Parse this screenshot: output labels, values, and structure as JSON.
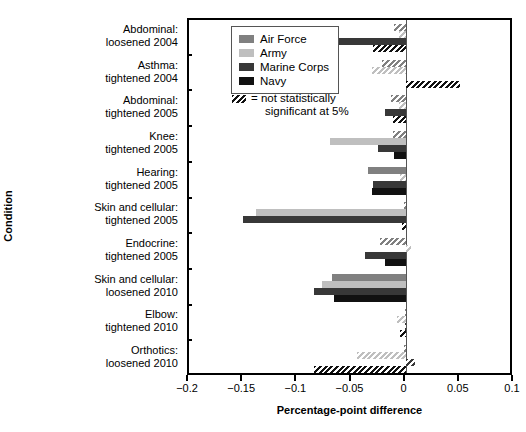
{
  "chart_data": {
    "type": "bar",
    "orientation": "horizontal",
    "title": "",
    "xlabel": "Percentage-point difference",
    "ylabel": "Condition",
    "xlim": [
      -0.2,
      0.1
    ],
    "xticks": [
      "-0.2",
      "-0.15",
      "-0.1",
      "-0.05",
      "0",
      "0.05",
      "0.1"
    ],
    "xtick_values": [
      -0.2,
      -0.15,
      -0.1,
      -0.05,
      0,
      0.05,
      0.1
    ],
    "grid": false,
    "zero_reference_line": true,
    "legend_position": "top-left-inside",
    "legend": [
      {
        "name": "Air Force",
        "color": "#808080"
      },
      {
        "name": "Army",
        "color": "#bfbfbf"
      },
      {
        "name": "Marine Corps",
        "color": "#383838"
      },
      {
        "name": "Navy",
        "color": "#111111"
      }
    ],
    "hatch_note": {
      "line1": "= not statistically",
      "line2": "significant at 5%"
    },
    "categories": [
      "Abdominal:\nloosened 2004",
      "Asthma:\ntightened 2004",
      "Abdominal:\ntightened 2005",
      "Knee:\ntightened 2005",
      "Hearing:\ntightened 2005",
      "Skin and cellular:\ntightened 2005",
      "Endocrine:\ntightened 2005",
      "Skin and cellular:\nloosened 2010",
      "Elbow:\ntightened 2010",
      "Orthotics:\nloosened 2010"
    ],
    "category_lines": [
      [
        "Abdominal:",
        "loosened 2004"
      ],
      [
        "Asthma:",
        "tightened 2004"
      ],
      [
        "Abdominal:",
        "tightened 2005"
      ],
      [
        "Knee:",
        "tightened 2005"
      ],
      [
        "Hearing:",
        "tightened 2005"
      ],
      [
        "Skin and cellular:",
        "tightened 2005"
      ],
      [
        "Endocrine:",
        "tightened 2005"
      ],
      [
        "Skin and cellular:",
        "loosened 2010"
      ],
      [
        "Elbow:",
        "tightened 2010"
      ],
      [
        "Orthotics:",
        "loosened 2010"
      ]
    ],
    "series": [
      {
        "name": "Air Force",
        "color": "#808080",
        "values": [
          -0.011,
          -0.022,
          -0.014,
          -0.012,
          -0.035,
          -0.002,
          -0.024,
          -0.068,
          -0.001,
          -0.002
        ],
        "not_significant": [
          true,
          true,
          true,
          true,
          false,
          true,
          true,
          false,
          true,
          true
        ]
      },
      {
        "name": "Army",
        "color": "#bfbfbf",
        "values": [
          -0.006,
          -0.031,
          -0.006,
          -0.07,
          -0.005,
          -0.138,
          0.005,
          -0.077,
          -0.008,
          -0.045
        ],
        "not_significant": [
          true,
          true,
          true,
          false,
          true,
          false,
          true,
          false,
          true,
          true
        ]
      },
      {
        "name": "Marine Corps",
        "color": "#383838",
        "values": [
          -0.089,
          0.0,
          -0.019,
          -0.026,
          -0.03,
          -0.15,
          -0.038,
          -0.085,
          -0.001,
          0.009
        ],
        "not_significant": [
          false,
          true,
          false,
          false,
          false,
          false,
          false,
          false,
          true,
          true
        ]
      },
      {
        "name": "Navy",
        "color": "#111111",
        "values": [
          -0.03,
          0.05,
          -0.012,
          -0.011,
          -0.031,
          -0.003,
          -0.019,
          -0.066,
          -0.005,
          -0.085
        ],
        "not_significant": [
          true,
          true,
          true,
          false,
          false,
          true,
          false,
          false,
          true,
          true
        ]
      }
    ]
  },
  "axes": {
    "y_title": "Condition",
    "x_title": "Percentage-point difference"
  }
}
